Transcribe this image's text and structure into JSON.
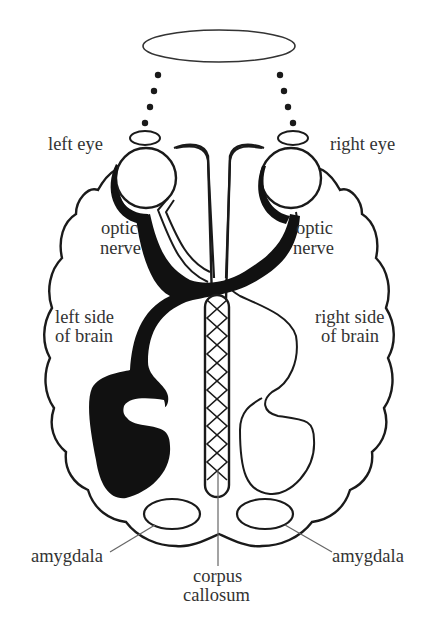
{
  "diagram": {
    "title": "",
    "labels": {
      "left_eye": "left eye",
      "right_eye": "right eye",
      "optic_nerve_left_1": "optic",
      "optic_nerve_left_2": "nerve",
      "optic_nerve_right_1": "optic",
      "optic_nerve_right_2": "nerve",
      "left_brain_1": "left side",
      "left_brain_2": "of brain",
      "right_brain_1": "right side",
      "right_brain_2": "of brain",
      "amygdala_left": "amygdala",
      "amygdala_right": "amygdala",
      "corpus_1": "corpus",
      "corpus_2": "callosum"
    },
    "colors": {
      "stroke": "#1a1a1a",
      "fill_dark": "#111111",
      "leader": "#666666",
      "text": "#333333"
    }
  }
}
